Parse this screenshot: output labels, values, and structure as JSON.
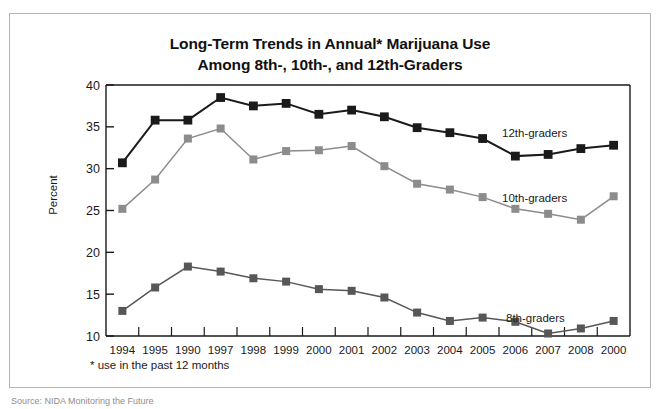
{
  "figure": {
    "title_line_1": "Long-Term Trends in Annual* Marijuana Use",
    "title_line_2": "Among 8th-, 10th-, and 12th-Graders",
    "footnote": "* use in the past 12 months",
    "bottom_caption": "Source: NIDA Monitoring the Future",
    "colors": {
      "grade12": "#1a1a1a",
      "grade10": "#8c8c8c",
      "grade8": "#575757",
      "axis": "#1a1a1a",
      "frame": "#b4b4b4"
    }
  },
  "chart_data": {
    "type": "line",
    "title": "Long-Term Trends in Annual* Marijuana Use Among 8th-, 10th-, and 12th-Graders",
    "xlabel": "",
    "ylabel": "Percent",
    "ylim": [
      10,
      40
    ],
    "yticks": [
      10,
      15,
      20,
      25,
      30,
      35,
      40
    ],
    "ytick_labels": [
      "10",
      "15",
      "20",
      "25",
      "30",
      "35",
      "40"
    ],
    "grid": false,
    "legend_position": "inline-right",
    "categories": [
      "1994",
      "1995",
      "1990",
      "1997",
      "1998",
      "1999",
      "2000",
      "2001",
      "2002",
      "2003",
      "2004",
      "2005",
      "2006",
      "2007",
      "2008",
      "2000"
    ],
    "series": [
      {
        "name": "12th-graders",
        "color": "#1a1a1a",
        "values": [
          30.7,
          35.8,
          35.8,
          38.5,
          37.5,
          37.8,
          36.5,
          37.0,
          36.2,
          34.9,
          34.3,
          33.6,
          31.5,
          31.7,
          32.4,
          32.8
        ]
      },
      {
        "name": "10th-graders",
        "color": "#8c8c8c",
        "values": [
          25.2,
          28.7,
          33.6,
          34.8,
          31.1,
          32.1,
          32.2,
          32.7,
          30.3,
          28.2,
          27.5,
          26.6,
          25.2,
          24.6,
          23.9,
          26.7
        ]
      },
      {
        "name": "8th-graders",
        "color": "#575757",
        "values": [
          13.0,
          15.8,
          18.3,
          17.7,
          16.9,
          16.5,
          15.6,
          15.4,
          14.6,
          12.8,
          11.8,
          12.2,
          11.7,
          10.3,
          10.9,
          11.8
        ]
      }
    ]
  }
}
